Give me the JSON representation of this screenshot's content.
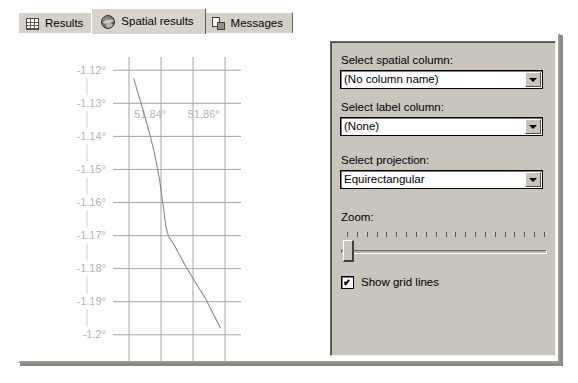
{
  "tabs": [
    {
      "id": "results",
      "label": "Results",
      "icon": "grid-icon",
      "selected": false
    },
    {
      "id": "spatial",
      "label": "Spatial results",
      "icon": "globe-icon",
      "selected": true
    },
    {
      "id": "messages",
      "label": "Messages",
      "icon": "message-icon",
      "selected": false
    }
  ],
  "options": {
    "spatial_column": {
      "label": "Select spatial column:",
      "value": "(No column name)"
    },
    "label_column": {
      "label": "Select label column:",
      "value": "(None)"
    },
    "projection": {
      "label": "Select projection:",
      "value": "Equirectangular"
    },
    "zoom": {
      "label": "Zoom:",
      "value": 1,
      "min": 1,
      "max": 21,
      "tick_count": 21
    },
    "show_grid_lines": {
      "label": "Show grid lines",
      "checked": true
    }
  },
  "chart_data": {
    "type": "line",
    "title": "",
    "xlabel": "",
    "ylabel": "",
    "grid": true,
    "legend": null,
    "x_tick_labels": [
      "51.84°",
      "51.86°"
    ],
    "x_tick_values": [
      51.84,
      51.86
    ],
    "y_tick_labels": [
      "-1.12°",
      "-1.13°",
      "-1.14°",
      "-1.15°",
      "-1.16°",
      "-1.17°",
      "-1.18°",
      "-1.19°",
      "-1.2°"
    ],
    "y_tick_values": [
      -1.12,
      -1.13,
      -1.14,
      -1.15,
      -1.16,
      -1.17,
      -1.18,
      -1.19,
      -1.2
    ],
    "xlim": [
      51.826,
      51.874
    ],
    "ylim": [
      -1.204,
      -1.116
    ],
    "x_gridlines": [
      51.832,
      51.844,
      51.856,
      51.868
    ],
    "series": [
      {
        "name": "geography",
        "color": "#8b8b86",
        "points": [
          [
            51.8338,
            -1.1226
          ],
          [
            51.8366,
            -1.1302
          ],
          [
            51.8396,
            -1.1388
          ],
          [
            51.8416,
            -1.1452
          ],
          [
            51.8434,
            -1.1528
          ],
          [
            51.8448,
            -1.1608
          ],
          [
            51.8458,
            -1.1672
          ],
          [
            51.8468,
            -1.1702
          ],
          [
            51.8492,
            -1.1732
          ],
          [
            51.8532,
            -1.1792
          ],
          [
            51.8572,
            -1.1846
          ],
          [
            51.8604,
            -1.1886
          ],
          [
            51.8646,
            -1.1952
          ],
          [
            51.8662,
            -1.1978
          ]
        ]
      }
    ],
    "grid_color": "#9a9a95",
    "tick_label_color": "#b5b5b0"
  }
}
